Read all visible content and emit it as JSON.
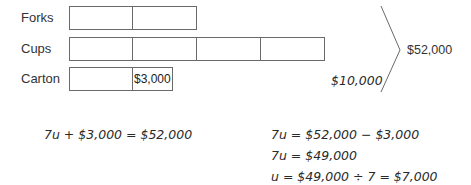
{
  "bar_model": {
    "rows": [
      {
        "label": "Forks",
        "units": 2
      },
      {
        "label": "Cups",
        "units": 4
      },
      {
        "label": "Carton",
        "units": 1,
        "extra_label": "$3,000"
      }
    ],
    "total_label": "$52,000",
    "difference_label": "$10,000"
  },
  "equations": {
    "left": [
      "7u + $3,000 = $52,000"
    ],
    "right": [
      "7u = $52,000 − $3,000",
      "7u = $49,000",
      "u = $49,000 ÷ 7 = $7,000"
    ]
  },
  "colors": {
    "line": "#6a6a6a",
    "text": "#2b2b2b"
  }
}
